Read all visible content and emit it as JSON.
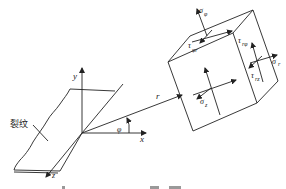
{
  "diagram": {
    "crack_label": "裂纹",
    "axes": {
      "x": "x",
      "y": "y",
      "z": "z"
    },
    "radius_label": "r",
    "angle_label": "φ",
    "stress_labels": {
      "sigma_phi": {
        "main": "σ",
        "sub": "φ"
      },
      "sigma_r": {
        "main": "σ",
        "sub": "r"
      },
      "sigma_z": {
        "main": "σ",
        "sub": "z"
      },
      "tau_phi_r": {
        "main": "τ",
        "sub": "φr"
      },
      "tau_r_phi": {
        "main": "τ",
        "sub": "rφ"
      },
      "tau_rz": {
        "main": "τ",
        "sub": "rz"
      }
    }
  },
  "colors": {
    "line": "#222222",
    "background": "#ffffff"
  }
}
